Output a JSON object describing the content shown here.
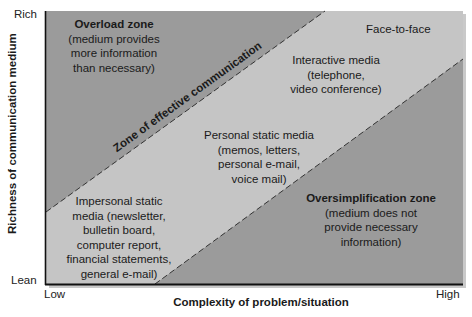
{
  "diagram": {
    "axes": {
      "y_label": "Richness of communication medium",
      "y_top": "Rich",
      "y_bottom": "Lean",
      "x_label": "Complexity of problem/situation",
      "x_left": "Low",
      "x_right": "High"
    },
    "zones": {
      "overload": {
        "title": "Overload zone",
        "lines": [
          "(medium provides",
          "more information",
          "than necessary)"
        ]
      },
      "effective": {
        "title": "Zone of effective communication"
      },
      "oversimplification": {
        "title": "Oversimplification zone",
        "lines": [
          "(medium does not",
          "provide necessary",
          "information)"
        ]
      }
    },
    "media": {
      "face_to_face": "Face-to-face",
      "interactive": [
        "Interactive media",
        "(telephone,",
        "video conference)"
      ],
      "personal_static": [
        "Personal static media",
        "(memos, letters,",
        "personal e-mail,",
        "voice mail)"
      ],
      "impersonal_static": [
        "Impersonal static",
        "media (newsletter,",
        "bulletin board,",
        "computer report,",
        "financial statements,",
        "general e-mail)"
      ]
    },
    "colors": {
      "outer_zone": "#9b9b9b",
      "effective_zone": "#c5c5c5",
      "axis": "#111111",
      "dash": "#333333",
      "shadow": "#bdbdbd"
    }
  }
}
